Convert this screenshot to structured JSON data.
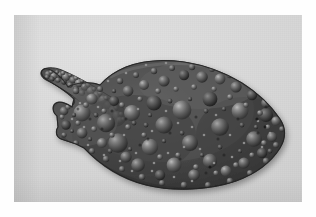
{
  "image": {
    "kind": "photograph",
    "subject_label": "sea-cucumber-specimen",
    "orientation": "landscape",
    "color_mode": "grayscale",
    "width_px": 316,
    "height_px": 217
  },
  "border": {
    "name": "white-photo-border",
    "color": "#ffffff",
    "left_px": 14,
    "top_px": 15,
    "right_px": 14,
    "bottom_px": 15
  },
  "plate": {
    "name": "photo-plate",
    "background_color": "#d9d9d9",
    "highlight_color": "#e2e2e2",
    "shadow_color": "#cfcfcf",
    "width_px": 288,
    "height_px": 187
  },
  "specimen": {
    "name": "holothurian-body",
    "body_color": "#4a4a4a",
    "body_dark": "#303030",
    "body_mid": "#5a5a5a",
    "tubercle_highlight": "#949494",
    "tubercle_shadow": "#262626",
    "outline_color": "#1f1f1f",
    "parts": [
      {
        "label": "curved-tentacle-arm",
        "position": "upper-left"
      },
      {
        "label": "anterior-head-region",
        "position": "left"
      },
      {
        "label": "main-trunk",
        "position": "center"
      },
      {
        "label": "posterior-taper",
        "position": "right"
      },
      {
        "label": "ventral-margin",
        "position": "bottom"
      }
    ],
    "surface_texture": "dense rounded tubercles",
    "tubercle_count_visible": 320
  }
}
